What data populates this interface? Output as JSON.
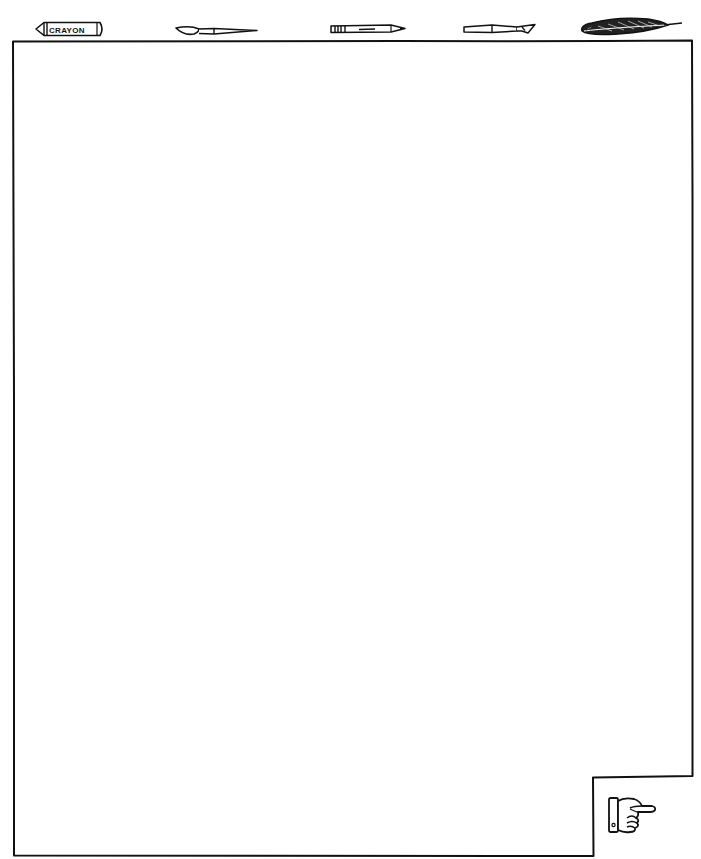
{
  "toolbar": {
    "tools": [
      {
        "id": "crayon",
        "label": "Crayon",
        "icon": "crayon-icon",
        "text": "CRAYON"
      },
      {
        "id": "paintbrush",
        "label": "Paintbrush",
        "icon": "paintbrush-icon"
      },
      {
        "id": "pencil",
        "label": "Pencil",
        "icon": "pencil-icon"
      },
      {
        "id": "knife",
        "label": "Craft knife",
        "icon": "craft-knife-icon"
      },
      {
        "id": "quill",
        "label": "Feather quill",
        "icon": "quill-pen-icon"
      }
    ]
  },
  "canvas": {
    "label": "Drawing canvas"
  },
  "navigation": {
    "next_label": "Next page",
    "next_icon": "pointing-hand-icon"
  },
  "colors": {
    "ink": "#111111",
    "paper": "#ffffff"
  }
}
